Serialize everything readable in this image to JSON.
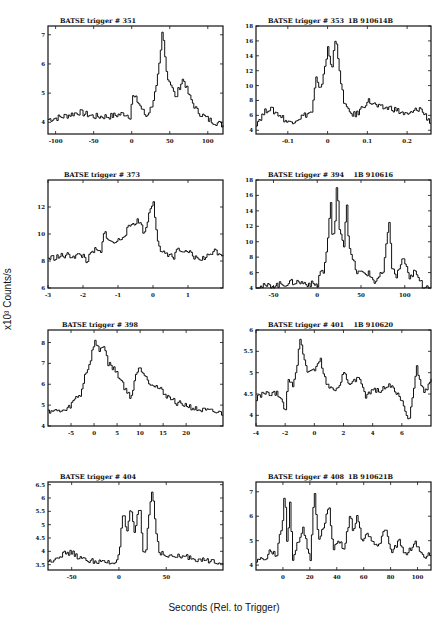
{
  "figure": {
    "ylabel": "x10³ Counts/s",
    "xlabel": "Seconds (Rel. to Trigger)"
  },
  "panels": [
    {
      "title": "BATSE trigger # 351",
      "id": "1B 910614B"
    },
    {
      "title": "BATSE trigger # 353",
      "id": "1B 910614"
    },
    {
      "title": "BATSE trigger # 373",
      "id": "1B 910616"
    },
    {
      "title": "BATSE trigger # 394",
      "id": "1B 910619"
    },
    {
      "title": "BATSE trigger # 398",
      "id": "1B 910620"
    },
    {
      "title": "BATSE trigger # 401",
      "id": "1B 910620B"
    },
    {
      "title": "BATSE trigger # 404",
      "id": "1B 910621B"
    },
    {
      "title": "BATSE trigger # 408",
      "id": "1B 910621"
    }
  ],
  "chart_data": [
    {
      "type": "line",
      "title": "BATSE trigger # 351",
      "subtitle": "1B 910614B",
      "xlabel": "Seconds (Rel. to Trigger)",
      "ylabel": "x10³ Counts/s",
      "xlim": [
        -110,
        120
      ],
      "ylim": [
        3.6,
        7.3
      ],
      "xticks": [
        -100,
        -50,
        0,
        50,
        100
      ],
      "yticks": [
        4,
        5,
        6,
        7
      ],
      "x": [
        -110,
        -90,
        -70,
        -50,
        -30,
        -10,
        -2,
        0,
        5,
        10,
        18,
        25,
        32,
        37,
        40,
        43,
        47,
        52,
        57,
        62,
        67,
        70,
        75,
        85,
        100,
        120
      ],
      "y": [
        4.1,
        4.2,
        4.35,
        4.2,
        4.2,
        4.3,
        4.2,
        4.9,
        4.8,
        4.6,
        4.2,
        4.5,
        5.2,
        6.2,
        7.2,
        6.3,
        5.5,
        5.3,
        4.8,
        5.2,
        5.5,
        5.3,
        4.9,
        4.4,
        4.1,
        3.9
      ]
    },
    {
      "type": "line",
      "title": "BATSE trigger # 353",
      "subtitle": "1B 910614",
      "xlabel": "Seconds (Rel. to Trigger)",
      "ylabel": "x10³ Counts/s",
      "xlim": [
        -0.18,
        0.26
      ],
      "ylim": [
        3.5,
        18
      ],
      "xticks": [
        -0.1,
        0.0,
        0.1,
        0.2
      ],
      "yticks": [
        4,
        6,
        8,
        10,
        12,
        14,
        16,
        18
      ],
      "x": [
        -0.18,
        -0.15,
        -0.12,
        -0.1,
        -0.08,
        -0.06,
        -0.04,
        -0.03,
        -0.02,
        -0.01,
        0.0,
        0.01,
        0.015,
        0.02,
        0.025,
        0.03,
        0.04,
        0.05,
        0.07,
        0.1,
        0.13,
        0.16,
        0.2,
        0.23,
        0.26
      ],
      "y": [
        5,
        7,
        6,
        5,
        5.5,
        6,
        6.5,
        11,
        9,
        12,
        15,
        12,
        15,
        17,
        14,
        11,
        8,
        6.5,
        6,
        8,
        7,
        7,
        6,
        7,
        5
      ]
    },
    {
      "type": "line",
      "title": "BATSE trigger # 373",
      "subtitle": "1B 910616",
      "xlabel": "Seconds (Rel. to Trigger)",
      "ylabel": "x10³ Counts/s",
      "xlim": [
        -3,
        2
      ],
      "ylim": [
        6,
        14
      ],
      "xticks": [
        -3,
        -2,
        -1,
        0,
        1
      ],
      "yticks": [
        6,
        8,
        10,
        12
      ],
      "x": [
        -3,
        -2.5,
        -2.0,
        -1.9,
        -1.7,
        -1.5,
        -1.4,
        -1.2,
        -1.0,
        -0.8,
        -0.6,
        -0.4,
        -0.25,
        -0.1,
        0.0,
        0.1,
        0.2,
        0.4,
        0.6,
        0.7,
        0.8,
        1.0,
        1.2,
        1.5,
        1.7,
        2.0
      ],
      "y": [
        8.2,
        8.4,
        8.4,
        8.0,
        8.8,
        8.6,
        10.2,
        9.3,
        9.5,
        10.1,
        10.8,
        11.0,
        10.0,
        11.8,
        12.5,
        10.0,
        8.5,
        8.6,
        8.2,
        9.1,
        8.4,
        8.7,
        8.2,
        8.2,
        8.8,
        8.5
      ]
    },
    {
      "type": "line",
      "title": "BATSE trigger # 394",
      "subtitle": "1B 910619",
      "xlabel": "Seconds (Rel. to Trigger)",
      "ylabel": "x10³ Counts/s",
      "xlim": [
        -70,
        130
      ],
      "ylim": [
        4,
        18
      ],
      "xticks": [
        -50,
        0,
        50,
        100
      ],
      "yticks": [
        4,
        6,
        8,
        10,
        12,
        14,
        16,
        18
      ],
      "x": [
        -70,
        -50,
        -25,
        0,
        3,
        7,
        12,
        15,
        17,
        20,
        22,
        25,
        30,
        33,
        36,
        45,
        58,
        65,
        75,
        80,
        82,
        85,
        90,
        98,
        105,
        110,
        120,
        130
      ],
      "y": [
        4.1,
        4.3,
        4.8,
        4.4,
        6.3,
        6.0,
        10.5,
        15.5,
        10.0,
        12.5,
        17.5,
        12.0,
        9.5,
        15.5,
        9.0,
        6.0,
        5.9,
        4.8,
        6.0,
        11.0,
        13.0,
        6.5,
        5.5,
        8.0,
        5.0,
        6.2,
        4.3,
        4.2
      ]
    },
    {
      "type": "line",
      "title": "BATSE trigger # 398",
      "subtitle": "1B 910620",
      "xlabel": "Seconds (Rel. to Trigger)",
      "ylabel": "x10³ Counts/s",
      "xlim": [
        -10,
        28
      ],
      "ylim": [
        4,
        8.6
      ],
      "xticks": [
        -5,
        0,
        5,
        10,
        15,
        20
      ],
      "yticks": [
        4,
        5,
        6,
        7,
        8
      ],
      "x": [
        -10,
        -8,
        -6,
        -4,
        -3,
        -2,
        -1,
        0,
        1,
        2,
        3,
        4,
        5,
        6,
        7,
        8,
        9,
        10,
        12,
        14,
        16,
        18,
        20,
        22,
        25,
        28
      ],
      "y": [
        4.75,
        4.7,
        4.75,
        5.35,
        5.5,
        6.5,
        7.0,
        8.1,
        7.6,
        7.9,
        7.0,
        6.8,
        6.5,
        6.1,
        5.6,
        5.4,
        6.5,
        6.8,
        6.1,
        5.8,
        5.4,
        5.1,
        5.0,
        4.8,
        4.7,
        4.6
      ]
    },
    {
      "type": "line",
      "title": "BATSE trigger # 401",
      "subtitle": "1B 910620B",
      "xlabel": "Seconds (Rel. to Trigger)",
      "ylabel": "x10³ Counts/s",
      "xlim": [
        -4,
        8
      ],
      "ylim": [
        3.75,
        6.0
      ],
      "xticks": [
        -4,
        -2,
        0,
        2,
        4,
        6
      ],
      "yticks": [
        4.0,
        4.5,
        5.0,
        5.5,
        6.0
      ],
      "x": [
        -4,
        -3.5,
        -2.5,
        -2.0,
        -1.8,
        -1.5,
        -1.2,
        -1.0,
        -0.5,
        0,
        0.4,
        0.8,
        1.5,
        2.0,
        2.5,
        3.0,
        3.5,
        4.0,
        4.5,
        5.0,
        5.5,
        6.0,
        6.5,
        7.0,
        7.5,
        8.0
      ],
      "y": [
        4.4,
        4.5,
        4.5,
        4.1,
        4.9,
        4.7,
        5.2,
        5.8,
        5.0,
        5.1,
        5.3,
        4.7,
        4.6,
        5.0,
        4.7,
        4.9,
        4.4,
        4.6,
        4.6,
        4.7,
        4.6,
        4.3,
        3.9,
        5.1,
        4.5,
        4.9
      ]
    },
    {
      "type": "line",
      "title": "BATSE trigger # 404",
      "subtitle": "1B 910621B",
      "xlabel": "Seconds (Rel. to Trigger)",
      "ylabel": "x10³ Counts/s",
      "xlim": [
        -75,
        110
      ],
      "ylim": [
        3.3,
        6.6
      ],
      "xticks": [
        -50,
        0,
        50
      ],
      "yticks": [
        3.5,
        4.0,
        4.5,
        5.0,
        5.5,
        6.0,
        6.5
      ],
      "x": [
        -75,
        -60,
        -50,
        -40,
        -20,
        -5,
        0,
        4,
        8,
        12,
        16,
        20,
        22,
        25,
        28,
        30,
        35,
        38,
        42,
        50,
        70,
        90,
        110
      ],
      "y": [
        3.6,
        3.9,
        3.95,
        3.7,
        3.6,
        3.55,
        4.0,
        5.5,
        4.6,
        5.7,
        4.6,
        5.5,
        5.6,
        4.0,
        3.9,
        5.0,
        6.4,
        5.0,
        4.0,
        3.8,
        3.8,
        3.65,
        3.6
      ]
    },
    {
      "type": "line",
      "title": "BATSE trigger # 408",
      "subtitle": "1B 910621",
      "xlabel": "Seconds (Rel. to Trigger)",
      "ylabel": "x10³ Counts/s",
      "xlim": [
        -20,
        110
      ],
      "ylim": [
        3.8,
        7.4
      ],
      "xticks": [
        0,
        20,
        40,
        60,
        80,
        100
      ],
      "yticks": [
        4,
        5,
        6,
        7
      ],
      "x": [
        -20,
        -12,
        -10,
        -5,
        0,
        1,
        3,
        5,
        7,
        10,
        15,
        20,
        23,
        26,
        30,
        34,
        37,
        42,
        45,
        50,
        52,
        55,
        58,
        63,
        70,
        76,
        80,
        86,
        90,
        98,
        105,
        110
      ],
      "y": [
        4.2,
        4.3,
        4.6,
        4.4,
        6.0,
        7.3,
        4.6,
        6.7,
        4.2,
        4.8,
        5.5,
        4.2,
        7.1,
        5.0,
        5.6,
        6.4,
        4.7,
        5.0,
        4.6,
        6.2,
        5.2,
        6.2,
        5.0,
        5.3,
        4.7,
        5.5,
        4.5,
        5.0,
        4.4,
        4.9,
        4.3,
        4.5
      ]
    }
  ]
}
